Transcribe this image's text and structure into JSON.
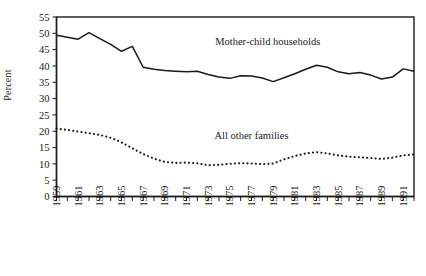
{
  "chart_data": {
    "type": "line",
    "title": "",
    "xlabel": "",
    "ylabel": "Percent",
    "ylim": [
      0,
      55
    ],
    "ytick_step": 5,
    "yticks": [
      0,
      5,
      10,
      15,
      20,
      25,
      30,
      35,
      40,
      45,
      50,
      55
    ],
    "grid": false,
    "legend_position": "inline-annotations",
    "x": [
      1959,
      1960,
      1961,
      1962,
      1963,
      1964,
      1965,
      1966,
      1967,
      1968,
      1969,
      1970,
      1971,
      1972,
      1973,
      1974,
      1975,
      1976,
      1977,
      1978,
      1979,
      1980,
      1981,
      1982,
      1983,
      1984,
      1985,
      1986,
      1987,
      1988,
      1989,
      1990,
      1991,
      1992
    ],
    "xticks_all_years": true,
    "xtick_labels": [
      "1959",
      "1961",
      "1963",
      "1965",
      "1967",
      "1969",
      "1971",
      "1973",
      "1975",
      "1977",
      "1979",
      "1981",
      "1983",
      "1985",
      "1987",
      "1989",
      "1991"
    ],
    "series": [
      {
        "name": "Mother-child households",
        "style": "solid",
        "color": "#1a1a1a",
        "label_text": "Mother-child households",
        "values": [
          49.4,
          48.8,
          48.2,
          50.2,
          48.4,
          46.6,
          44.5,
          46.0,
          39.6,
          39.0,
          38.6,
          38.4,
          38.2,
          38.4,
          37.4,
          36.6,
          36.2,
          37.0,
          36.9,
          36.3,
          35.2,
          36.4,
          37.6,
          39.0,
          40.2,
          39.6,
          38.2,
          37.6,
          38.0,
          37.2,
          36.0,
          36.6,
          39.1,
          38.4
        ]
      },
      {
        "name": "All other families",
        "style": "dotted",
        "color": "#1a1a1a",
        "label_text": "All other families",
        "values": [
          20.8,
          20.4,
          19.9,
          19.4,
          18.9,
          18.0,
          16.6,
          14.8,
          13.0,
          11.6,
          10.6,
          10.3,
          10.4,
          10.2,
          9.6,
          9.7,
          10.0,
          10.2,
          10.1,
          9.9,
          10.1,
          11.4,
          12.4,
          13.2,
          13.6,
          13.2,
          12.6,
          12.2,
          12.0,
          11.8,
          11.5,
          11.9,
          12.6,
          12.9
        ]
      }
    ],
    "annotations": [
      {
        "name": "mother-child-households-label",
        "text": "Mother-child households",
        "x": 1978.5,
        "y": 46.5
      },
      {
        "name": "all-other-families-label",
        "text": "All other families",
        "x": 1977.0,
        "y": 17.5
      }
    ]
  }
}
